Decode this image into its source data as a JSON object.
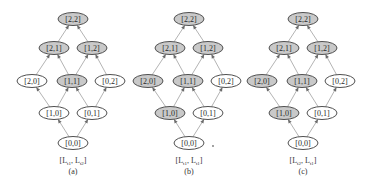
{
  "figure": {
    "type": "lattice-diagram",
    "colors": {
      "shaded_fill": "#c9c9c9",
      "plain_fill": "#ffffff",
      "stroke": "#505050",
      "edge": "#b4b4b4",
      "arrow": "#6a6a6a"
    },
    "node_layout": {
      "[2,2]": [
        73,
        19
      ],
      "[2,1]": [
        54,
        48
      ],
      "[1,2]": [
        92,
        48
      ],
      "[2,0]": [
        32,
        81
      ],
      "[1,1]": [
        72,
        81
      ],
      "[0,2]": [
        110,
        81
      ],
      "[1,0]": [
        54,
        113
      ],
      "[0,1]": [
        92,
        113
      ],
      "[0,0]": [
        73,
        143
      ]
    },
    "edges": [
      [
        "[0,0]",
        "[1,0]"
      ],
      [
        "[0,0]",
        "[0,1]"
      ],
      [
        "[1,0]",
        "[2,0]"
      ],
      [
        "[1,0]",
        "[1,1]"
      ],
      [
        "[0,1]",
        "[1,1]"
      ],
      [
        "[0,1]",
        "[0,2]"
      ],
      [
        "[2,0]",
        "[2,1]"
      ],
      [
        "[1,1]",
        "[2,1]"
      ],
      [
        "[1,1]",
        "[1,2]"
      ],
      [
        "[0,2]",
        "[1,2]"
      ],
      [
        "[2,1]",
        "[2,2]"
      ],
      [
        "[1,2]",
        "[2,2]"
      ]
    ],
    "panels": [
      {
        "id": "a",
        "offset_x": 0,
        "caption_main": "[L",
        "caption_sub1": "t1",
        "caption_mid": ", L",
        "caption_sub2": "t2",
        "caption_end": "]",
        "sublabel": "(a)",
        "shaded": [
          "[2,2]",
          "[2,1]",
          "[1,2]",
          "[1,1]"
        ]
      },
      {
        "id": "b",
        "offset_x": 116,
        "caption_main": "[L",
        "caption_sub1": "t1",
        "caption_mid": ", L",
        "caption_sub2": "t1",
        "caption_end": "]",
        "sublabel": "(b)",
        "shaded": [
          "[2,2]",
          "[2,1]",
          "[1,2]",
          "[2,0]",
          "[1,1]",
          "[1,0]"
        ],
        "stray_dot": [
          213,
          146
        ]
      },
      {
        "id": "c",
        "offset_x": 230,
        "caption_main": "[L",
        "caption_sub1": "t2",
        "caption_mid": ", L",
        "caption_sub2": "t1",
        "caption_end": "]",
        "sublabel": "(c)",
        "shaded": [
          "[2,2]",
          "[2,1]",
          "[1,2]",
          "[2,0]",
          "[1,1]",
          "[1,0]"
        ]
      }
    ]
  }
}
